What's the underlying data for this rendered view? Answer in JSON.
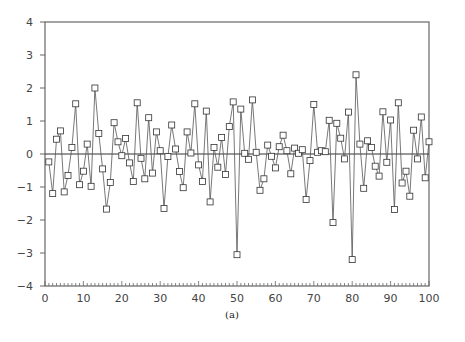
{
  "caption": "(a)",
  "chart_data": {
    "type": "line",
    "title": "",
    "caption": "(a)",
    "xlabel": "",
    "ylabel": "",
    "xlim": [
      0,
      100
    ],
    "ylim": [
      -4,
      4
    ],
    "grid": false,
    "legend": null,
    "marker": "open-square",
    "reference_line": {
      "y": 0
    },
    "x_ticks": [
      0,
      10,
      20,
      30,
      40,
      50,
      60,
      70,
      80,
      90,
      100
    ],
    "y_ticks": [
      -4,
      -3,
      -2,
      -1,
      0,
      1,
      2,
      3,
      4
    ],
    "x_tick_labels": [
      "0",
      "10",
      "20",
      "30",
      "40",
      "50",
      "60",
      "70",
      "80",
      "90",
      "100"
    ],
    "y_tick_labels": [
      "-4",
      "-3",
      "-2",
      "-1",
      "0",
      "1",
      "2",
      "3",
      "4"
    ],
    "x": [
      1,
      2,
      3,
      4,
      5,
      6,
      7,
      8,
      9,
      10,
      11,
      12,
      13,
      14,
      15,
      16,
      17,
      18,
      19,
      20,
      21,
      22,
      23,
      24,
      25,
      26,
      27,
      28,
      29,
      30,
      31,
      32,
      33,
      34,
      35,
      36,
      37,
      38,
      39,
      40,
      41,
      42,
      43,
      44,
      45,
      46,
      47,
      48,
      49,
      50,
      51,
      52,
      53,
      54,
      55,
      56,
      57,
      58,
      59,
      60,
      61,
      62,
      63,
      64,
      65,
      66,
      67,
      68,
      69,
      70,
      71,
      72,
      73,
      74,
      75,
      76,
      77,
      78,
      79,
      80,
      81,
      82,
      83,
      84,
      85,
      86,
      87,
      88,
      89,
      90,
      91,
      92,
      93,
      94,
      95,
      96,
      97,
      98,
      99,
      100
    ],
    "series": [
      {
        "name": "series",
        "values": [
          -0.24,
          -1.2,
          0.45,
          0.7,
          -1.15,
          -0.65,
          0.2,
          1.52,
          -0.93,
          -0.52,
          0.3,
          -0.98,
          2.0,
          0.62,
          -0.45,
          -1.67,
          -0.86,
          0.95,
          0.37,
          -0.05,
          0.47,
          -0.27,
          -0.83,
          1.55,
          -0.13,
          -0.75,
          1.1,
          -0.58,
          0.67,
          0.1,
          -1.65,
          -0.08,
          0.88,
          0.15,
          -0.53,
          -1.02,
          0.67,
          0.03,
          1.52,
          -0.33,
          -0.83,
          1.3,
          -1.45,
          0.2,
          -0.4,
          0.5,
          -0.62,
          0.83,
          1.58,
          -3.05,
          1.36,
          0.02,
          -0.16,
          1.64,
          0.05,
          -1.1,
          -0.75,
          0.27,
          -0.07,
          -0.42,
          0.22,
          0.57,
          0.1,
          -0.6,
          0.18,
          0.02,
          0.13,
          -1.38,
          -0.2,
          1.5,
          0.05,
          0.1,
          0.07,
          1.02,
          -2.08,
          0.93,
          0.48,
          -0.15,
          1.27,
          -3.2,
          2.4,
          0.3,
          -1.04,
          0.4,
          0.2,
          -0.37,
          -0.67,
          1.28,
          -0.25,
          1.03,
          -1.68,
          1.55,
          -0.88,
          -0.52,
          -1.28,
          0.72,
          -0.15,
          1.12,
          -0.72,
          0.37
        ]
      }
    ]
  },
  "colors": {
    "axis": "#666666",
    "line": "#555555",
    "marker_stroke": "#333333",
    "marker_fill": "#ffffff",
    "zero_line": "#333333"
  }
}
